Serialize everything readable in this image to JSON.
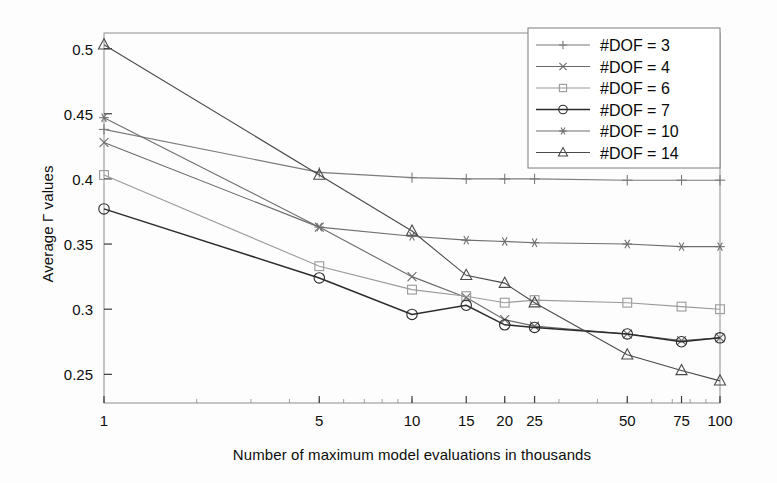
{
  "chart_data": {
    "type": "line",
    "title": "",
    "xlabel": "Number of maximum model evaluations in thousands",
    "ylabel": "Average Γ values",
    "xscale": "log",
    "xlim": [
      1,
      100
    ],
    "ylim": [
      0.228,
      0.512
    ],
    "yticks": [
      0.25,
      0.3,
      0.35,
      0.4,
      0.45,
      0.5
    ],
    "ytick_labels": [
      "0.25",
      "0.3",
      "0.35",
      "0.4",
      "0.45",
      "0.5"
    ],
    "xticks": [
      1,
      5,
      10,
      15,
      20,
      25,
      50,
      75,
      100
    ],
    "xtick_labels": [
      "1",
      "5",
      "10",
      "15",
      "20",
      "25",
      "50",
      "75",
      "100"
    ],
    "grid": false,
    "legend_position": "upper right",
    "x": [
      1,
      5,
      10,
      15,
      20,
      25,
      50,
      75,
      100
    ],
    "series": [
      {
        "name": "#DOF = 3",
        "marker": "plus",
        "color": "#7b7b7b",
        "values": [
          0.438,
          0.405,
          0.401,
          0.4,
          0.4,
          0.4,
          0.399,
          0.399,
          0.399
        ]
      },
      {
        "name": "#DOF = 4",
        "marker": "x",
        "color": "#6a6a6a",
        "values": [
          0.428,
          0.363,
          0.325,
          0.309,
          0.292,
          0.287,
          0.281,
          0.276,
          0.278
        ]
      },
      {
        "name": "#DOF = 6",
        "marker": "square",
        "color": "#9a9a9a",
        "values": [
          0.403,
          0.333,
          0.315,
          0.31,
          0.305,
          0.307,
          0.305,
          0.302,
          0.3
        ]
      },
      {
        "name": "#DOF = 7",
        "marker": "circle",
        "color": "#2b2b2b",
        "values": [
          0.377,
          0.324,
          0.296,
          0.303,
          0.288,
          0.286,
          0.281,
          0.275,
          0.278
        ]
      },
      {
        "name": "#DOF = 10",
        "marker": "asterisk",
        "color": "#6f6f6f",
        "values": [
          0.447,
          0.363,
          0.356,
          0.353,
          0.352,
          0.351,
          0.35,
          0.348,
          0.348
        ]
      },
      {
        "name": "#DOF = 14",
        "marker": "triangle",
        "color": "#4a4a4a",
        "values": [
          0.503,
          0.403,
          0.36,
          0.326,
          0.32,
          0.305,
          0.265,
          0.253,
          0.245
        ]
      }
    ]
  },
  "legend": {
    "entries": [
      {
        "label": "#DOF = 3"
      },
      {
        "label": "#DOF = 4"
      },
      {
        "label": "#DOF = 6"
      },
      {
        "label": "#DOF = 7"
      },
      {
        "label": "#DOF = 10"
      },
      {
        "label": "#DOF = 14"
      }
    ]
  },
  "axes": {
    "x_title": "Number of maximum model evaluations in thousands",
    "y_title": "Average Γ values"
  }
}
